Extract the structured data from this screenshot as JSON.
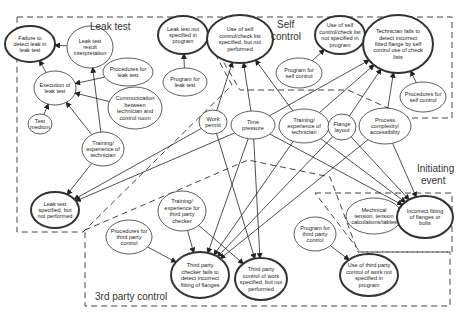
{
  "regions": {
    "leak_test": "Leak test",
    "self_control": [
      "Self",
      "control"
    ],
    "initiating_event": [
      "Initiating",
      "event"
    ],
    "third_party_control": "3rd party control"
  },
  "nodes": [
    {
      "id": "failure_detect_leak",
      "lines": [
        "Failure to",
        "detect leak in",
        "leak test"
      ],
      "cx": 30,
      "cy": 44,
      "rx": 25,
      "ry": 18,
      "bold": true
    },
    {
      "id": "leak_result_interp",
      "lines": [
        "Leak test",
        "result",
        "interpretation"
      ],
      "cx": 90,
      "cy": 47,
      "rx": 23,
      "ry": 21,
      "bold": false
    },
    {
      "id": "leak_not_specified",
      "lines": [
        "Leak test not",
        "specified in",
        "program"
      ],
      "cx": 183,
      "cy": 35,
      "rx": 25,
      "ry": 19,
      "bold": true
    },
    {
      "id": "program_leak",
      "lines": [
        "Program for",
        "leak test"
      ],
      "cx": 185,
      "cy": 82,
      "rx": 22,
      "ry": 14,
      "bold": false
    },
    {
      "id": "procedures_leak",
      "lines": [
        "Procedures for",
        "leak test"
      ],
      "cx": 128,
      "cy": 72,
      "rx": 25,
      "ry": 14,
      "bold": false
    },
    {
      "id": "execution_leak",
      "lines": [
        "Execution of",
        "leak test"
      ],
      "cx": 55,
      "cy": 88,
      "rx": 21,
      "ry": 17,
      "bold": false
    },
    {
      "id": "communication",
      "lines": [
        "Communication",
        "between",
        "technician and",
        "control room"
      ],
      "cx": 135,
      "cy": 108,
      "rx": 27,
      "ry": 21,
      "bold": false
    },
    {
      "id": "test_medium",
      "lines": [
        "Test",
        "medium"
      ],
      "cx": 40,
      "cy": 124,
      "rx": 12,
      "ry": 10,
      "bold": false
    },
    {
      "id": "training_tech_leak",
      "lines": [
        "Training/",
        "experience of",
        "technician"
      ],
      "cx": 103,
      "cy": 149,
      "rx": 21,
      "ry": 17,
      "bold": false
    },
    {
      "id": "leak_specified_not_performed",
      "lines": [
        "Leak test",
        "specified, but",
        "not performed"
      ],
      "cx": 55,
      "cy": 210,
      "rx": 24,
      "ry": 18,
      "bold": true
    },
    {
      "id": "use_self_specified",
      "lines": [
        "Use of self",
        "control/check list",
        "specified, but not",
        "performed"
      ],
      "cx": 240,
      "cy": 39,
      "rx": 33,
      "ry": 24,
      "bold": true
    },
    {
      "id": "use_self_not_specified",
      "lines": [
        "Use of self",
        "control/check list",
        "not specified in",
        "program"
      ],
      "cx": 340,
      "cy": 35,
      "rx": 25,
      "ry": 19,
      "bold": true
    },
    {
      "id": "program_self",
      "lines": [
        "Program for",
        "self control"
      ],
      "cx": 299,
      "cy": 73,
      "rx": 23,
      "ry": 15,
      "bold": false
    },
    {
      "id": "tech_fails_detect",
      "lines": [
        "Technician fails to",
        "detect incorrect",
        "fitted flange by self",
        "control use of check",
        "lists"
      ],
      "cx": 398,
      "cy": 44,
      "rx": 35,
      "ry": 29,
      "bold": true
    },
    {
      "id": "procedures_self",
      "lines": [
        "Procedures for",
        "self control"
      ],
      "cx": 423,
      "cy": 97,
      "rx": 23,
      "ry": 15,
      "bold": false
    },
    {
      "id": "work_permit",
      "lines": [
        "Work",
        "permit"
      ],
      "cx": 213,
      "cy": 122,
      "rx": 14,
      "ry": 12,
      "bold": false
    },
    {
      "id": "time_pressure",
      "lines": [
        "Time",
        "pressure"
      ],
      "cx": 253,
      "cy": 125,
      "rx": 22,
      "ry": 14,
      "bold": false
    },
    {
      "id": "training_tech_self",
      "lines": [
        "Training/",
        "experience of",
        "technician"
      ],
      "cx": 304,
      "cy": 126,
      "rx": 25,
      "ry": 17,
      "bold": false
    },
    {
      "id": "flange_layout",
      "lines": [
        "Flange",
        "layout"
      ],
      "cx": 342,
      "cy": 127,
      "rx": 14,
      "ry": 13,
      "bold": false
    },
    {
      "id": "process_complexity",
      "lines": [
        "Process",
        "complexity/",
        "accessibility"
      ],
      "cx": 385,
      "cy": 126,
      "rx": 26,
      "ry": 18,
      "bold": false
    },
    {
      "id": "mechanical_tension",
      "lines": [
        "Mechnical",
        "tension, tension",
        "calculations/tables"
      ],
      "cx": 374,
      "cy": 216,
      "rx": 28,
      "ry": 18,
      "bold": false
    },
    {
      "id": "incorrect_fitting",
      "lines": [
        "Incorrect fitting",
        "of flanges or",
        "bolts"
      ],
      "cx": 425,
      "cy": 217,
      "rx": 28,
      "ry": 21,
      "bold": true
    },
    {
      "id": "training_3rd",
      "lines": [
        "Training/",
        "experience for",
        "third party",
        "checker"
      ],
      "cx": 182,
      "cy": 211,
      "rx": 24,
      "ry": 20,
      "bold": false
    },
    {
      "id": "procedures_3rd",
      "lines": [
        "Procedures for",
        "third party",
        "control"
      ],
      "cx": 129,
      "cy": 237,
      "rx": 23,
      "ry": 17,
      "bold": false
    },
    {
      "id": "program_3rd",
      "lines": [
        "Program for",
        "third party",
        "control"
      ],
      "cx": 315,
      "cy": 234,
      "rx": 21,
      "ry": 17,
      "bold": false
    },
    {
      "id": "third_checker_fails",
      "lines": [
        "Third party",
        "checker fails to",
        "detect incorrect",
        "fitting of flanges"
      ],
      "cx": 200,
      "cy": 275,
      "rx": 29,
      "ry": 23,
      "bold": true
    },
    {
      "id": "third_control_not_performed",
      "lines": [
        "Third party",
        "control of work",
        "specified, but not",
        "performed"
      ],
      "cx": 261,
      "cy": 279,
      "rx": 26,
      "ry": 21,
      "bold": true
    },
    {
      "id": "third_control_not_specified",
      "lines": [
        "Use of third party",
        "control of work not",
        "specified in",
        "program"
      ],
      "cx": 369,
      "cy": 275,
      "rx": 29,
      "ry": 21,
      "bold": true
    }
  ],
  "edges": [
    [
      "execution_leak",
      "failure_detect_leak"
    ],
    [
      "leak_result_interp",
      "failure_detect_leak"
    ],
    [
      "procedures_leak",
      "execution_leak"
    ],
    [
      "communication",
      "execution_leak"
    ],
    [
      "test_medium",
      "execution_leak"
    ],
    [
      "training_tech_leak",
      "execution_leak"
    ],
    [
      "training_tech_leak",
      "leak_result_interp"
    ],
    [
      "training_tech_leak",
      "leak_specified_not_performed"
    ],
    [
      "program_leak",
      "leak_not_specified"
    ],
    [
      "time_pressure",
      "leak_specified_not_performed"
    ],
    [
      "work_permit",
      "leak_specified_not_performed"
    ],
    [
      "work_permit",
      "use_self_specified"
    ],
    [
      "time_pressure",
      "use_self_specified"
    ],
    [
      "training_tech_self",
      "use_self_specified"
    ],
    [
      "program_self",
      "use_self_not_specified"
    ],
    [
      "time_pressure",
      "tech_fails_detect"
    ],
    [
      "training_tech_self",
      "tech_fails_detect"
    ],
    [
      "flange_layout",
      "tech_fails_detect"
    ],
    [
      "process_complexity",
      "tech_fails_detect"
    ],
    [
      "procedures_self",
      "tech_fails_detect"
    ],
    [
      "time_pressure",
      "incorrect_fitting"
    ],
    [
      "training_tech_self",
      "incorrect_fitting"
    ],
    [
      "flange_layout",
      "incorrect_fitting"
    ],
    [
      "process_complexity",
      "incorrect_fitting"
    ],
    [
      "mechanical_tension",
      "incorrect_fitting"
    ],
    [
      "work_permit",
      "third_control_not_performed"
    ],
    [
      "time_pressure",
      "third_checker_fails"
    ],
    [
      "time_pressure",
      "third_control_not_performed"
    ],
    [
      "training_tech_self",
      "third_checker_fails"
    ],
    [
      "flange_layout",
      "third_checker_fails"
    ],
    [
      "process_complexity",
      "third_checker_fails"
    ],
    [
      "training_3rd",
      "third_checker_fails"
    ],
    [
      "training_3rd",
      "third_control_not_performed"
    ],
    [
      "procedures_3rd",
      "third_checker_fails"
    ],
    [
      "program_3rd",
      "third_control_not_specified"
    ]
  ]
}
